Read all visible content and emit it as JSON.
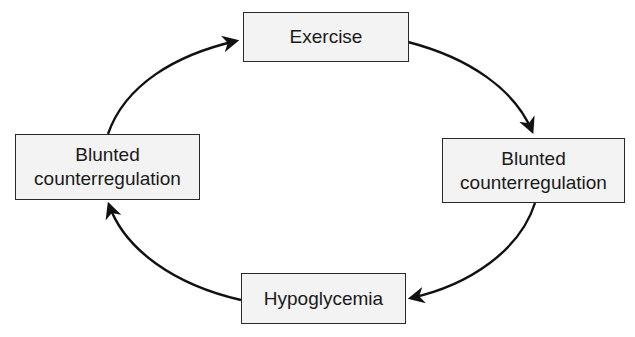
{
  "diagram": {
    "type": "cycle",
    "nodes": [
      {
        "id": "exercise",
        "label_lines": [
          "Exercise"
        ]
      },
      {
        "id": "blunted-right",
        "label_lines": [
          "Blunted",
          "counterregulation"
        ]
      },
      {
        "id": "hypoglycemia",
        "label_lines": [
          "Hypoglycemia"
        ]
      },
      {
        "id": "blunted-left",
        "label_lines": [
          "Blunted",
          "counterregulation"
        ]
      }
    ],
    "edges": [
      {
        "from": "exercise",
        "to": "blunted-right"
      },
      {
        "from": "blunted-right",
        "to": "hypoglycemia"
      },
      {
        "from": "hypoglycemia",
        "to": "blunted-left"
      },
      {
        "from": "blunted-left",
        "to": "exercise"
      }
    ],
    "colors": {
      "box_fill": "#f3f3f3",
      "box_border": "#2a2a2a",
      "arrow": "#111111",
      "text": "#1a1a1a"
    }
  }
}
